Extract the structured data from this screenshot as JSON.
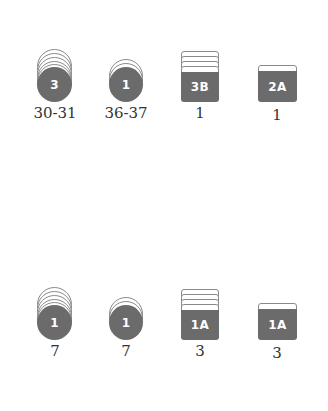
{
  "rows": [
    {
      "items": [
        {
          "type": "coin-stack-tall",
          "badge": "3",
          "label": "30-31"
        },
        {
          "type": "coin-stack-short",
          "badge": "1",
          "label": "36-37"
        },
        {
          "type": "card-stack-tall",
          "badge": "3B",
          "label": "1"
        },
        {
          "type": "card-stack-short",
          "badge": "2A",
          "label": "1"
        }
      ]
    },
    {
      "items": [
        {
          "type": "coin-stack-tall",
          "badge": "1",
          "label": "7"
        },
        {
          "type": "coin-stack-short",
          "badge": "1",
          "label": "7"
        },
        {
          "type": "card-stack-tall",
          "badge": "1A",
          "label": "3"
        },
        {
          "type": "card-stack-short",
          "badge": "1A",
          "label": "3"
        }
      ]
    }
  ],
  "colors": {
    "icon_fill": "#6b6b6b",
    "outline": "#8a8a8a",
    "text": "#333333"
  }
}
